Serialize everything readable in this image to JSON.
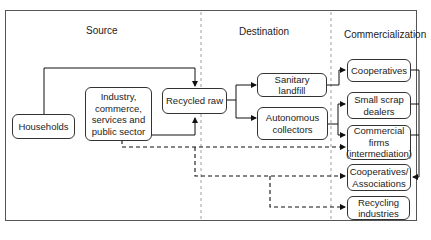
{
  "columns": {
    "source": "Source",
    "destination": "Destination",
    "commercialization": "Commercialization"
  },
  "nodes": {
    "households": "Households",
    "industry": "Industry, commerce, services and public sector",
    "recycled_raw": "Recycled raw",
    "sanitary_landfill": "Sanitary landfill",
    "autonomous_collectors": "Autonomous collectors",
    "cooperatives": "Cooperatives",
    "small_scrap_dealers": "Small scrap dealers",
    "commercial_firms": "Commercial firms (intermediation)",
    "cooperatives_associations": "Cooperatives/ Associations",
    "recycling_industries": "Recycling industries"
  },
  "edges": [
    {
      "from": "households",
      "to": "recycled_raw",
      "style": "solid"
    },
    {
      "from": "industry",
      "to": "recycled_raw",
      "style": "solid"
    },
    {
      "from": "recycled_raw",
      "to": "sanitary_landfill",
      "style": "solid"
    },
    {
      "from": "recycled_raw",
      "to": "autonomous_collectors",
      "style": "solid"
    },
    {
      "from": "sanitary_landfill",
      "to": "cooperatives",
      "style": "solid"
    },
    {
      "from": "autonomous_collectors",
      "to": "small_scrap_dealers",
      "style": "solid"
    },
    {
      "from": "autonomous_collectors",
      "to": "commercial_firms",
      "style": "solid"
    },
    {
      "from": "cooperatives",
      "to": "cooperatives_associations",
      "style": "solid"
    },
    {
      "from": "small_scrap_dealers",
      "to": "cooperatives_associations",
      "style": "solid"
    },
    {
      "from": "commercial_firms",
      "to": "cooperatives_associations",
      "style": "solid"
    },
    {
      "from": "industry",
      "to": "commercial_firms",
      "style": "dashed"
    },
    {
      "from": "industry",
      "to": "cooperatives_associations",
      "style": "dashed"
    },
    {
      "from": "industry",
      "to": "recycling_industries",
      "style": "dashed"
    }
  ]
}
